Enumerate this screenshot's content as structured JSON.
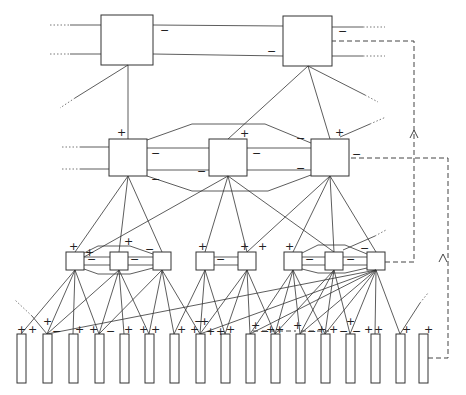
{
  "diagram": {
    "signs": {
      "plus": "+",
      "minus": "−"
    },
    "levels": [
      {
        "name": "level-1",
        "boxes": [
          {
            "x": 101,
            "y": 15,
            "w": 52,
            "h": 50
          },
          {
            "x": 283,
            "y": 16,
            "w": 49,
            "h": 50
          }
        ]
      },
      {
        "name": "level-2",
        "boxes": [
          {
            "x": 109,
            "y": 139,
            "w": 38,
            "h": 37
          },
          {
            "x": 209,
            "y": 139,
            "w": 38,
            "h": 37
          },
          {
            "x": 311,
            "y": 139,
            "w": 38,
            "h": 37
          }
        ]
      },
      {
        "name": "level-3",
        "boxes": [
          {
            "x": 66,
            "y": 252,
            "w": 18,
            "h": 18
          },
          {
            "x": 110,
            "y": 252,
            "w": 18,
            "h": 18
          },
          {
            "x": 153,
            "y": 252,
            "w": 18,
            "h": 18
          },
          {
            "x": 196,
            "y": 252,
            "w": 18,
            "h": 18
          },
          {
            "x": 238,
            "y": 252,
            "w": 18,
            "h": 18
          },
          {
            "x": 284,
            "y": 252,
            "w": 18,
            "h": 18
          },
          {
            "x": 325,
            "y": 252,
            "w": 18,
            "h": 18
          },
          {
            "x": 367,
            "y": 252,
            "w": 18,
            "h": 18
          }
        ]
      },
      {
        "name": "level-4",
        "bars": [
          17,
          43,
          69,
          95,
          120,
          145,
          170,
          196,
          221,
          246,
          271,
          296,
          321,
          346,
          371,
          396,
          419
        ],
        "y": 334,
        "w": 9,
        "h": 49
      }
    ],
    "feedback_paths": 3
  }
}
